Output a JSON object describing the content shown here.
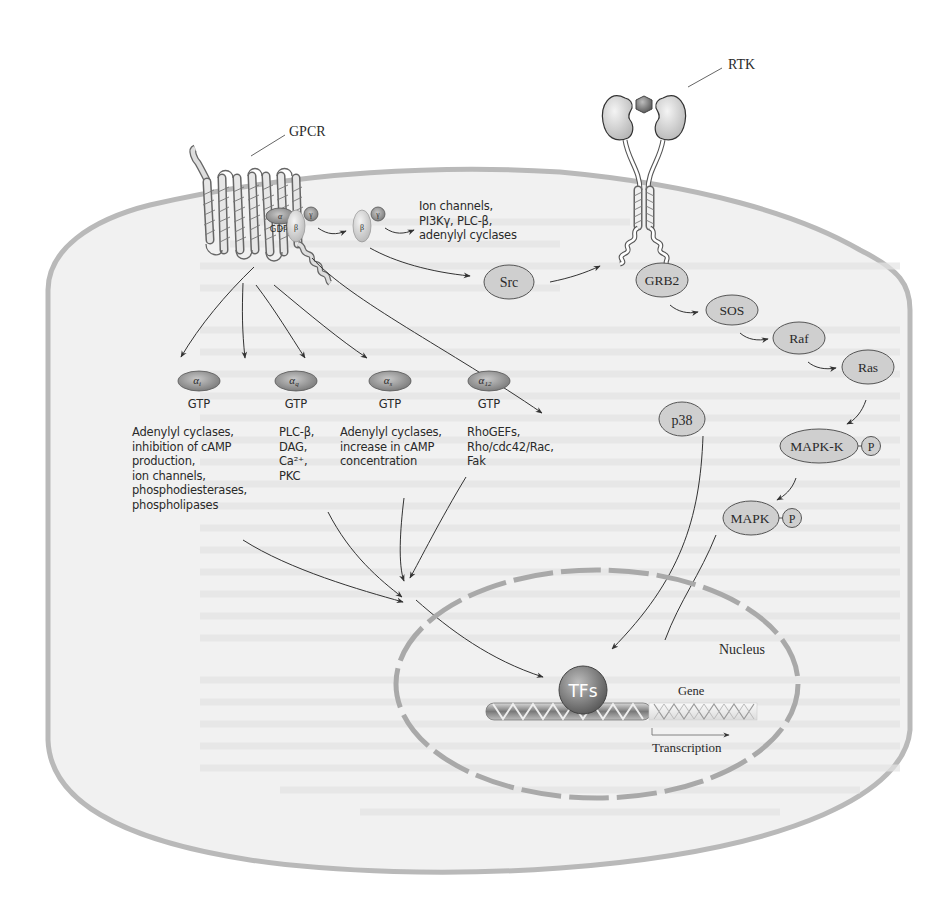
{
  "diagram": {
    "colors": {
      "cell_fill": "#f1f1f1",
      "cell_border": "#b9b9b9",
      "node_fill": "#cfcfcf",
      "node_stroke": "#555555",
      "g_alpha_fill": "#9a9a9a",
      "arrow": "#333333",
      "text": "#2a2a2a"
    },
    "receptors": {
      "gpcr": {
        "label": "GPCR"
      },
      "rtk": {
        "label": "RTK"
      }
    },
    "g_protein_complex": {
      "alpha": "α",
      "beta": "β",
      "gamma": "γ",
      "gdp": "GDP"
    },
    "beta_gamma": {
      "beta": "β",
      "gamma": "γ",
      "effectors": "Ion channels,\nPI3Kγ, PLC-β,\nadenylyl cyclases"
    },
    "g_alpha_subunits": [
      {
        "symbol": "α",
        "subscript": "i",
        "nucleotide": "GTP",
        "effectors": "Adenylyl cyclases,\ninhibition of cAMP\nproduction,\nion channels,\nphosphodiesterases,\nphospholipases"
      },
      {
        "symbol": "α",
        "subscript": "q",
        "nucleotide": "GTP",
        "effectors": "PLC-β,\nDAG,\nCa²⁺,\nPKC"
      },
      {
        "symbol": "α",
        "subscript": "s",
        "nucleotide": "GTP",
        "effectors": "Adenylyl cyclases,\nincrease in cAMP\nconcentration"
      },
      {
        "symbol": "α",
        "subscript": "12",
        "nucleotide": "GTP",
        "effectors": "RhoGEFs,\nRho/cdc42/Rac,\nFak"
      }
    ],
    "kinase_nodes": {
      "src": "Src",
      "p38": "p38",
      "grb2": "GRB2",
      "sos": "SOS",
      "raf": "Raf",
      "ras": "Ras",
      "mapkk": "MAPK-K",
      "mapk": "MAPK",
      "phospho": "P"
    },
    "nucleus": {
      "label": "Nucleus",
      "tfs": "TFs",
      "gene": "Gene",
      "transcription": "Transcription"
    }
  }
}
